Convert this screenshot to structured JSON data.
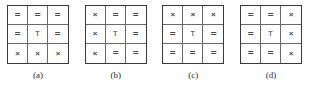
{
  "figure": {
    "background_color": "#ffffff",
    "border_color": "#3a3a3a",
    "cell_line_color": "#6a6a6a",
    "symbol_color": "#4a4a4a",
    "symbols": {
      "equals": "=",
      "times": "×",
      "tee": "T"
    },
    "panels": [
      {
        "caption": "(a)",
        "rows": [
          [
            "=",
            "=",
            "="
          ],
          [
            "=",
            "T",
            "="
          ],
          [
            "×",
            "×",
            "×"
          ]
        ]
      },
      {
        "caption": "(b)",
        "rows": [
          [
            "×",
            "=",
            "="
          ],
          [
            "×",
            "T",
            "="
          ],
          [
            "×",
            "=",
            "="
          ]
        ]
      },
      {
        "caption": "(c)",
        "rows": [
          [
            "×",
            "×",
            "×"
          ],
          [
            "=",
            "T",
            "="
          ],
          [
            "=",
            "=",
            "="
          ]
        ]
      },
      {
        "caption": "(d)",
        "rows": [
          [
            "=",
            "=",
            "×"
          ],
          [
            "=",
            "T",
            "×"
          ],
          [
            "=",
            "=",
            "×"
          ]
        ]
      }
    ]
  }
}
